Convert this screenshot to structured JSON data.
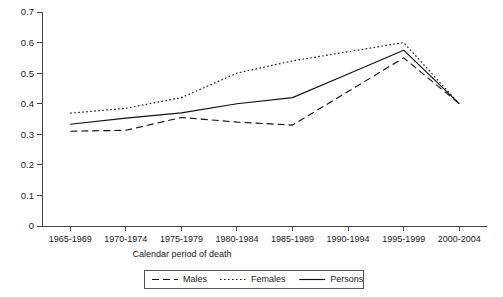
{
  "chart_data": {
    "type": "line",
    "title": "",
    "xlabel": "Calendar period of death",
    "ylabel": "",
    "categories": [
      "1965-1969",
      "1970-1974",
      "1975-1979",
      "1980-1984",
      "1985-1989",
      "1990-1994",
      "1995-1999",
      "2000-2004"
    ],
    "series": [
      {
        "name": "Males",
        "style": "dashed",
        "values": [
          0.31,
          0.313,
          0.355,
          0.34,
          0.33,
          0.44,
          0.55,
          0.4
        ]
      },
      {
        "name": "Females",
        "style": "dotted",
        "values": [
          0.369,
          0.385,
          0.42,
          0.5,
          0.54,
          0.57,
          0.6,
          0.4
        ]
      },
      {
        "name": "Persons",
        "style": "solid",
        "values": [
          0.333,
          0.353,
          0.37,
          0.4,
          0.42,
          0.497,
          0.575,
          0.4
        ]
      }
    ],
    "ylim": [
      0,
      0.7
    ],
    "yticks": [
      "0",
      "0.1",
      "0.2",
      "0.3",
      "0.4",
      "0.5",
      "0.6",
      "0.7"
    ],
    "ytick_values": [
      0,
      0.1,
      0.2,
      0.3,
      0.4,
      0.5,
      0.6,
      0.7
    ],
    "grid": false,
    "legend_position": "bottom",
    "legend_entries": [
      "Males",
      "Females",
      "Persons"
    ],
    "line_color": "#111111"
  }
}
